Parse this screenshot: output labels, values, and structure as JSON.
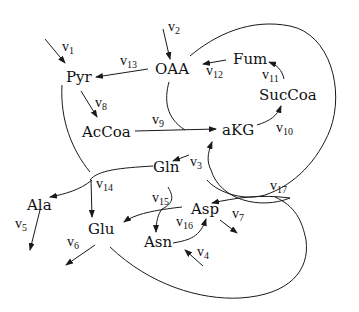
{
  "nodes": {
    "pyr": "Pyr",
    "oaa": "OAA",
    "fum": "Fum",
    "succoa": "SucCoa",
    "accoa": "AcCoa",
    "akg": "aKG",
    "gln": "Gln",
    "ala": "Ala",
    "glu": "Glu",
    "asp": "Asp",
    "asn": "Asn"
  },
  "fluxes": {
    "v1": {
      "base": "v",
      "sub": "1"
    },
    "v2": {
      "base": "v",
      "sub": "2"
    },
    "v3": {
      "base": "v",
      "sub": "3"
    },
    "v4": {
      "base": "v",
      "sub": "4"
    },
    "v5": {
      "base": "v",
      "sub": "5"
    },
    "v6": {
      "base": "v",
      "sub": "6"
    },
    "v7": {
      "base": "v",
      "sub": "7"
    },
    "v8": {
      "base": "v",
      "sub": "8"
    },
    "v9": {
      "base": "v",
      "sub": "9"
    },
    "v10": {
      "base": "v",
      "sub": "10"
    },
    "v11": {
      "base": "v",
      "sub": "11"
    },
    "v12": {
      "base": "v",
      "sub": "12"
    },
    "v13": {
      "base": "v",
      "sub": "13"
    },
    "v14": {
      "base": "v",
      "sub": "14"
    },
    "v15": {
      "base": "v",
      "sub": "15"
    },
    "v16": {
      "base": "v",
      "sub": "16"
    },
    "v17": {
      "base": "v",
      "sub": "17"
    }
  },
  "colors": {
    "stroke": "#1a1a1a",
    "background": "#ffffff"
  }
}
